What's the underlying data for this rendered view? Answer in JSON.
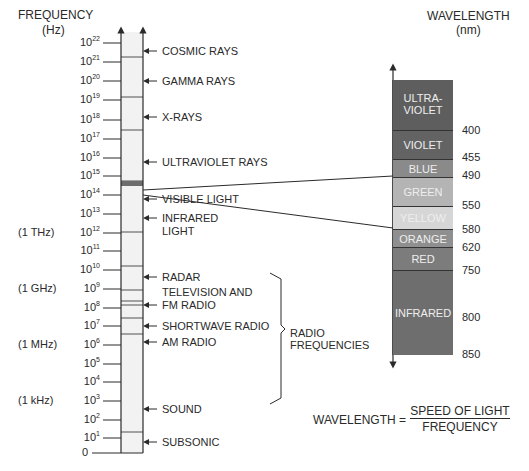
{
  "axis": {
    "title": "FREQUENCY",
    "unit": "(Hz)",
    "ticks": [
      {
        "base": "10",
        "exp": "22",
        "y": 43
      },
      {
        "base": "10",
        "exp": "21",
        "y": 62
      },
      {
        "base": "10",
        "exp": "20",
        "y": 81
      },
      {
        "base": "10",
        "exp": "19",
        "y": 100
      },
      {
        "base": "10",
        "exp": "18",
        "y": 120
      },
      {
        "base": "10",
        "exp": "17",
        "y": 139
      },
      {
        "base": "10",
        "exp": "16",
        "y": 158
      },
      {
        "base": "10",
        "exp": "15",
        "y": 176
      },
      {
        "base": "10",
        "exp": "14",
        "y": 195
      },
      {
        "base": "10",
        "exp": "13",
        "y": 214
      },
      {
        "base": "10",
        "exp": "12",
        "y": 233
      },
      {
        "base": "10",
        "exp": "11",
        "y": 251
      },
      {
        "base": "10",
        "exp": "10",
        "y": 270
      },
      {
        "base": "10",
        "exp": "9",
        "y": 289
      },
      {
        "base": "10",
        "exp": "8",
        "y": 308
      },
      {
        "base": "10",
        "exp": "7",
        "y": 326
      },
      {
        "base": "10",
        "exp": "6",
        "y": 345
      },
      {
        "base": "10",
        "exp": "5",
        "y": 364
      },
      {
        "base": "10",
        "exp": "4",
        "y": 382
      },
      {
        "base": "10",
        "exp": "3",
        "y": 401
      },
      {
        "base": "10",
        "exp": "2",
        "y": 420
      },
      {
        "base": "10",
        "exp": "1",
        "y": 438
      },
      {
        "base": "0",
        "exp": "",
        "y": 453
      }
    ],
    "unit_notes": [
      {
        "text": "(1 THz)",
        "y": 233
      },
      {
        "text": "(1 GHz)",
        "y": 289
      },
      {
        "text": "(1 MHz)",
        "y": 345
      },
      {
        "text": "(1 kHz)",
        "y": 401
      }
    ]
  },
  "column_dividers": [
    57,
    97,
    130,
    181,
    183,
    185,
    232,
    266,
    290,
    301,
    305,
    318,
    334,
    432
  ],
  "bands": [
    {
      "label": "COSMIC RAYS",
      "y": 51
    },
    {
      "label": "GAMMA RAYS",
      "y": 81
    },
    {
      "label": "X-RAYS",
      "y": 117
    },
    {
      "label": "ULTRAVIOLET RAYS",
      "y": 162
    },
    {
      "label": "VISIBLE LIGHT",
      "y": 199
    },
    {
      "label": "INFRARED",
      "label2": "LIGHT",
      "y": 218
    },
    {
      "label": "RADAR",
      "y": 277
    },
    {
      "label": "TELEVISION AND",
      "label2": "FM RADIO",
      "y": 305,
      "label_first_line_offset": -13
    },
    {
      "label": "SHORTWAVE RADIO",
      "y": 326
    },
    {
      "label": "AM RADIO",
      "y": 342
    },
    {
      "label": "SOUND",
      "y": 409
    },
    {
      "label": "SUBSONIC",
      "y": 442
    }
  ],
  "bracket": {
    "label": "RADIO",
    "label2": "FREQUENCIES"
  },
  "wavelength": {
    "title": "WAVELENGTH",
    "unit": "(nm)",
    "segments": [
      {
        "label": "ULTRA-",
        "label2": "VIOLET",
        "top": 80,
        "bottom": 130,
        "color": "#5e5e5e"
      },
      {
        "label": "VIOLET",
        "top": 130,
        "bottom": 159,
        "color": "#636363"
      },
      {
        "label": "BLUE",
        "top": 159,
        "bottom": 177,
        "color": "#8a8a8a"
      },
      {
        "label": "GREEN",
        "top": 177,
        "bottom": 206,
        "color": "#b4b4b4"
      },
      {
        "label": "YELLOW",
        "top": 206,
        "bottom": 229,
        "color": "#d6d6d6"
      },
      {
        "label": "ORANGE",
        "top": 229,
        "bottom": 247,
        "color": "#8f8f8f"
      },
      {
        "label": "RED",
        "top": 247,
        "bottom": 270,
        "color": "#7c7c7c"
      },
      {
        "label": "INFRARED",
        "top": 270,
        "bottom": 355,
        "color": "#6e6e6e"
      }
    ],
    "values": [
      {
        "text": "400",
        "y": 130
      },
      {
        "text": "455",
        "y": 157
      },
      {
        "text": "490",
        "y": 175
      },
      {
        "text": "550",
        "y": 205
      },
      {
        "text": "580",
        "y": 229
      },
      {
        "text": "620",
        "y": 247
      },
      {
        "text": "750",
        "y": 270
      },
      {
        "text": "800",
        "y": 317
      },
      {
        "text": "850",
        "y": 354
      }
    ]
  },
  "formula": {
    "lhs": "WAVELENGTH =",
    "numerator": "SPEED OF LIGHT",
    "denominator": "FREQUENCY"
  }
}
